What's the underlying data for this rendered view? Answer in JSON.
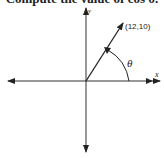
{
  "problem": {
    "text": "Compute the value of cos θ."
  },
  "diagram": {
    "point_label": "(12,10)",
    "angle_label": "θ",
    "x_axis_label": "x",
    "y_axis_label": "y",
    "point": {
      "x": 12,
      "y": 10
    },
    "line_color": "#222222"
  }
}
